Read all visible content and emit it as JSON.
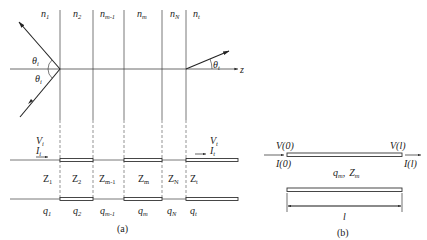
{
  "figure_a": {
    "caption": "(a)",
    "layers": [
      {
        "n": "n",
        "n_sub": "1",
        "Z": "Z",
        "Z_sub": "1",
        "q": "q",
        "q_sub": "1"
      },
      {
        "n": "n",
        "n_sub": "2",
        "Z": "Z",
        "Z_sub": "2",
        "q": "q",
        "q_sub": "2"
      },
      {
        "n": "n",
        "n_sub": "m-1",
        "Z": "Z",
        "Z_sub": "m-1",
        "q": "q",
        "q_sub": "m-1"
      },
      {
        "n": "n",
        "n_sub": "m",
        "Z": "Z",
        "Z_sub": "m",
        "q": "q",
        "q_sub": "m"
      },
      {
        "n": "n",
        "n_sub": "N",
        "Z": "Z",
        "Z_sub": "N",
        "q": "q",
        "q_sub": "N"
      },
      {
        "n": "n",
        "n_sub": "t",
        "Z": "Z",
        "Z_sub": "t",
        "q": "q",
        "q_sub": "t"
      }
    ],
    "angles": {
      "reflected": {
        "sym": "θ",
        "sub": "i"
      },
      "incident": {
        "sym": "θ",
        "sub": "i"
      },
      "transmitted": {
        "sym": "θ",
        "sub": "t"
      }
    },
    "axis_label": "z",
    "input_port": {
      "V": "V",
      "V_sub": "i",
      "I": "I",
      "I_sub": "i"
    },
    "output_port": {
      "V": "V",
      "V_sub": "t",
      "I": "I",
      "I_sub": "t"
    }
  },
  "figure_b": {
    "caption": "(b)",
    "left_voltage": "V(0)",
    "left_current": "I(0)",
    "right_voltage": "V(l)",
    "right_current": "I(l)",
    "params": {
      "q": "q",
      "q_sub": "m",
      "sep": ",",
      "Z": "Z",
      "Z_sub": "m"
    },
    "length": "l"
  }
}
